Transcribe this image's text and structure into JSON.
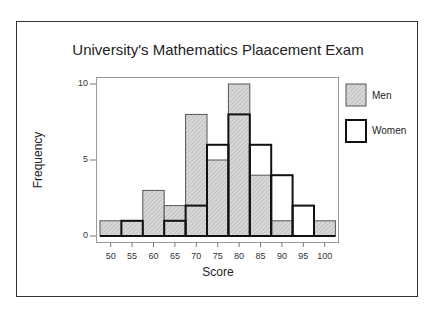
{
  "chart_data": {
    "type": "bar",
    "subtype": "overlaid-histogram",
    "title": "University's Mathematics Plaacement Exam",
    "xlabel": "Score",
    "ylabel": "Frequency",
    "categories": [
      50,
      55,
      60,
      65,
      70,
      75,
      80,
      85,
      90,
      95,
      100
    ],
    "series": [
      {
        "name": "Men",
        "style": "hatched-gray-fill",
        "values": [
          1,
          1,
          3,
          2,
          8,
          5,
          10,
          4,
          1,
          0,
          1
        ]
      },
      {
        "name": "Women",
        "style": "bold-outline-no-fill",
        "values": [
          0,
          1,
          0,
          1,
          2,
          6,
          8,
          6,
          4,
          2,
          0
        ]
      }
    ],
    "yticks": [
      0,
      5,
      10
    ],
    "xticks": [
      50,
      55,
      60,
      65,
      70,
      75,
      80,
      85,
      90,
      95,
      100
    ],
    "ylim": [
      0,
      10.5
    ],
    "grid": false,
    "legend_position": "right"
  },
  "labels": {
    "title": "University's Mathematics Plaacement Exam",
    "xlabel": "Score",
    "ylabel": "Frequency",
    "yticks": [
      "0",
      "5",
      "10"
    ],
    "xticks": [
      "50",
      "55",
      "60",
      "65",
      "70",
      "75",
      "80",
      "85",
      "90",
      "95",
      "100"
    ],
    "legend": [
      "Men",
      "Women"
    ]
  },
  "colors": {
    "men_fill": "#d4d4d4",
    "men_hatch": "#9a9a9a",
    "men_stroke": "#555555",
    "women_stroke": "#111111",
    "frame": "#333333",
    "plot_border": "#9a9a9a"
  }
}
